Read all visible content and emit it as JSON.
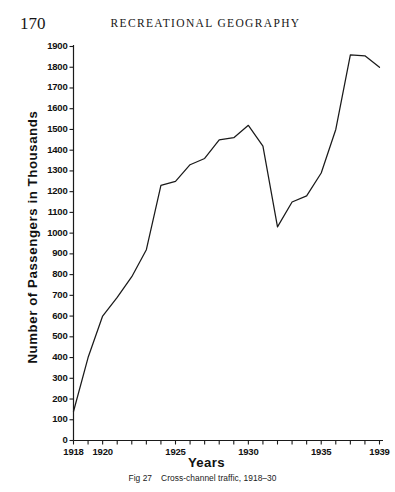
{
  "page": {
    "folio": "170",
    "running_head": "RECREATIONAL GEOGRAPHY"
  },
  "caption": {
    "figure_number": "Fig 27",
    "text": "Cross-channel traffic, 1918–30"
  },
  "axes": {
    "ylabel": "Number of Passengers in Thousands",
    "xlabel": "Years",
    "y_tick_labels": [
      "0",
      "100",
      "200",
      "300",
      "400",
      "500",
      "600",
      "700",
      "800",
      "900",
      "1000",
      "1100",
      "1200",
      "1300",
      "1400",
      "1500",
      "1600",
      "1700",
      "1800",
      "1900"
    ],
    "x_tick_labels": [
      "1918",
      "1920",
      "1925",
      "1930",
      "1935",
      "1939"
    ]
  },
  "chart_data": {
    "type": "line",
    "title": "Cross-channel traffic, 1918–30",
    "xlabel": "Years",
    "ylabel": "Number of Passengers in Thousands",
    "xlim": [
      1918,
      1939
    ],
    "ylim": [
      0,
      1900
    ],
    "grid": false,
    "legend": "none",
    "x_tick_step": 1,
    "x_labeled_ticks": [
      1918,
      1920,
      1925,
      1930,
      1935,
      1939
    ],
    "y_tick_step": 100,
    "x": [
      1918,
      1919,
      1920,
      1921,
      1922,
      1923,
      1924,
      1925,
      1926,
      1927,
      1928,
      1929,
      1930,
      1931,
      1932,
      1933,
      1934,
      1935,
      1936,
      1937,
      1938,
      1939
    ],
    "values": [
      140,
      400,
      600,
      690,
      790,
      920,
      1230,
      1250,
      1330,
      1360,
      1450,
      1460,
      1520,
      1420,
      1030,
      1150,
      1180,
      1290,
      1500,
      1860,
      1855,
      1800
    ],
    "series": [
      {
        "name": "Cross-channel passengers",
        "color": "#1a1a1a",
        "values": [
          140,
          400,
          600,
          690,
          790,
          920,
          1230,
          1250,
          1330,
          1360,
          1450,
          1460,
          1520,
          1420,
          1030,
          1150,
          1180,
          1290,
          1500,
          1860,
          1855,
          1800
        ]
      }
    ],
    "annotations": []
  },
  "style": {
    "line_color": "#1a1a1a",
    "axis_color": "#1a1a1a",
    "background": "#ffffff"
  }
}
